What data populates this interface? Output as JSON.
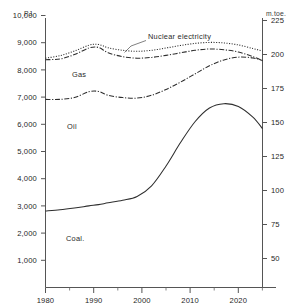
{
  "chart_data": {
    "type": "line",
    "title": "",
    "xlabel": "",
    "ylabel": "PJ",
    "y2label": "m.toe.",
    "grid": false,
    "legend_position": "inline-annotations",
    "xlim": [
      1980,
      2025
    ],
    "ylim": [
      0,
      10600
    ],
    "y2lim": [
      0,
      238.7
    ],
    "x_ticks_major": [
      "1980",
      "1990",
      "2000",
      "2010",
      "2020"
    ],
    "x_ticks_minor": [
      "1985",
      "1995",
      "2005",
      "2015",
      "2025"
    ],
    "y_ticks": [
      "1,000",
      "2,000",
      "3,000",
      "4,000",
      "5,000",
      "6,000",
      "7,000",
      "8,000",
      "9,000",
      "10,000"
    ],
    "y2_ticks": [
      "50",
      "75",
      "100",
      "125",
      "150",
      "175",
      "200",
      "225"
    ],
    "series": [
      {
        "name": "Nuclear electricity",
        "label": "Nuclear electricity",
        "style": "dotted",
        "x": [
          1980,
          1983,
          1986,
          1989,
          1991,
          1993,
          1996,
          1999,
          2002,
          2005,
          2008,
          2011,
          2014,
          2017,
          2020,
          2023,
          2025
        ],
        "values": [
          9020,
          9120,
          9300,
          9530,
          9560,
          9430,
          9330,
          9290,
          9330,
          9420,
          9520,
          9600,
          9640,
          9620,
          9540,
          9400,
          9300
        ]
      },
      {
        "name": "Gas",
        "label": "Gas",
        "style": "dash-dot",
        "x": [
          1980,
          1983,
          1986,
          1989,
          1991,
          1993,
          1996,
          1999,
          2002,
          2005,
          2008,
          2011,
          2014,
          2017,
          2020,
          2023,
          2025
        ],
        "values": [
          8960,
          8990,
          9160,
          9420,
          9440,
          9230,
          9080,
          9020,
          9050,
          9130,
          9230,
          9330,
          9380,
          9350,
          9260,
          9080,
          8920
        ]
      },
      {
        "name": "Oil",
        "label": "Oil",
        "style": "dash-dot",
        "x": [
          1980,
          1983,
          1986,
          1989,
          1991,
          1993,
          1996,
          1999,
          2002,
          2005,
          2008,
          2011,
          2014,
          2017,
          2020,
          2023,
          2025
        ],
        "values": [
          7400,
          7400,
          7470,
          7700,
          7710,
          7560,
          7470,
          7450,
          7560,
          7790,
          8080,
          8400,
          8720,
          8950,
          9060,
          9030,
          8930
        ]
      },
      {
        "name": "Coal",
        "label": "Coal.",
        "style": "solid",
        "x": [
          1980,
          1983,
          1986,
          1989,
          1991,
          1993,
          1996,
          1999,
          2002,
          2005,
          2008,
          2011,
          2014,
          2017,
          2020,
          2023,
          2025
        ],
        "values": [
          3010,
          3060,
          3130,
          3210,
          3260,
          3330,
          3430,
          3580,
          4000,
          4780,
          5700,
          6520,
          7060,
          7230,
          7120,
          6700,
          6250
        ]
      }
    ],
    "annotations": [
      {
        "text": "Nuclear electricity",
        "x": 1995.5,
        "y": 9960,
        "leader": true
      },
      {
        "text": "Gas",
        "x": 1986.5,
        "y": 8560,
        "leader": false
      },
      {
        "text": "Oil",
        "x": 1985.5,
        "y": 6660,
        "leader": false
      },
      {
        "text": "Coal.",
        "x": 1988.0,
        "y": 2530,
        "leader": false
      }
    ]
  },
  "axes": {
    "left_unit": "PJ",
    "right_unit": "m.toe."
  }
}
